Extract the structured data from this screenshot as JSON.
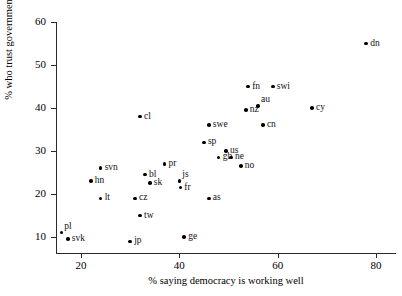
{
  "chart_data": {
    "type": "scatter",
    "title": "",
    "xlabel": "% saying democracy is working well",
    "ylabel": "% who trust government",
    "xlim": [
      13,
      82
    ],
    "ylim": [
      7.5,
      61
    ],
    "grid": false,
    "legend": "none",
    "xticks": [
      20,
      40,
      60,
      80
    ],
    "yticks": [
      10,
      20,
      30,
      40,
      50,
      60
    ],
    "xtick_labels": [
      "20",
      "40",
      "60",
      "80"
    ],
    "ytick_labels": [
      "10",
      "20",
      "30",
      "40",
      "50",
      "60"
    ],
    "points": [
      {
        "label": "pl",
        "x": 16.0,
        "y": 11.0,
        "pos": "up"
      },
      {
        "label": "svk",
        "x": 17.3,
        "y": 9.5,
        "pos": "right"
      },
      {
        "label": "hn",
        "x": 22.0,
        "y": 23.0,
        "pos": "right"
      },
      {
        "label": "svn",
        "x": 24.0,
        "y": 26.0,
        "pos": "right"
      },
      {
        "label": "lt",
        "x": 24.0,
        "y": 19.0,
        "pos": "right"
      },
      {
        "label": "jp",
        "x": 30.0,
        "y": 9.0,
        "pos": "right"
      },
      {
        "label": "cz",
        "x": 31.0,
        "y": 19.0,
        "pos": "right"
      },
      {
        "label": "tw",
        "x": 32.0,
        "y": 15.0,
        "pos": "right"
      },
      {
        "label": "cl",
        "x": 32.0,
        "y": 38.0,
        "pos": "right"
      },
      {
        "label": "bl",
        "x": 33.0,
        "y": 24.5,
        "pos": "right"
      },
      {
        "label": "sk",
        "x": 34.0,
        "y": 22.5,
        "pos": "right"
      },
      {
        "label": "pr",
        "x": 37.0,
        "y": 27.0,
        "pos": "right"
      },
      {
        "label": "js",
        "x": 40.0,
        "y": 23.0,
        "pos": "up"
      },
      {
        "label": "fr",
        "x": 40.2,
        "y": 21.5,
        "pos": "right"
      },
      {
        "label": "ge",
        "x": 41.0,
        "y": 10.0,
        "pos": "right"
      },
      {
        "label": "sp",
        "x": 45.0,
        "y": 32.0,
        "pos": "right"
      },
      {
        "label": "as",
        "x": 46.0,
        "y": 19.0,
        "pos": "right"
      },
      {
        "label": "swe",
        "x": 46.0,
        "y": 36.0,
        "pos": "right"
      },
      {
        "label": "gb",
        "x": 48.0,
        "y": 28.5,
        "pos": "right"
      },
      {
        "label": "us",
        "x": 49.5,
        "y": 30.0,
        "pos": "right"
      },
      {
        "label": "ne",
        "x": 50.5,
        "y": 28.5,
        "pos": "right"
      },
      {
        "label": "no",
        "x": 52.5,
        "y": 26.5,
        "pos": "right"
      },
      {
        "label": "nz",
        "x": 53.5,
        "y": 39.5,
        "pos": "right"
      },
      {
        "label": "fn",
        "x": 54.0,
        "y": 45.0,
        "pos": "right"
      },
      {
        "label": "au",
        "x": 56.0,
        "y": 40.5,
        "pos": "up"
      },
      {
        "label": "cn",
        "x": 57.0,
        "y": 36.0,
        "pos": "right"
      },
      {
        "label": "swi",
        "x": 59.0,
        "y": 45.0,
        "pos": "right"
      },
      {
        "label": "cy",
        "x": 67.0,
        "y": 40.0,
        "pos": "right"
      },
      {
        "label": "dn",
        "x": 78.0,
        "y": 55.0,
        "pos": "right"
      }
    ]
  }
}
